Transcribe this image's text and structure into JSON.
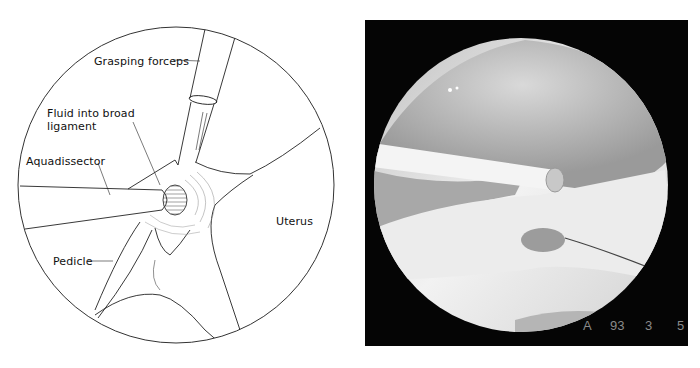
{
  "figure": {
    "left_panel": {
      "type": "line-illustration",
      "labels": {
        "grasping_forceps": "Grasping forceps",
        "fluid_line1": "Fluid into broad",
        "fluid_line2": "ligament",
        "aquadissector": "Aquadissector",
        "uterus": "Uterus",
        "pedicle": "Pedicle"
      }
    },
    "right_panel": {
      "type": "laparoscopic-photo",
      "overlay": {
        "letter": "A",
        "num1": "93",
        "num2": "3",
        "num3": "5"
      }
    }
  },
  "colors": {
    "ink": "#111111",
    "photo_background": "#050505",
    "overlay_text": "#8a8a8a"
  }
}
